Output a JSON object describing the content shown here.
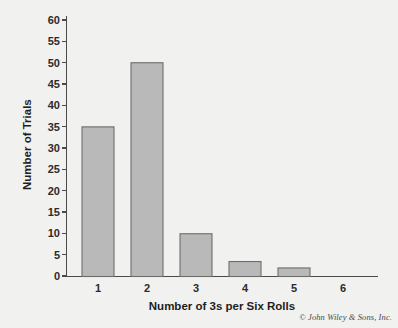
{
  "chart_data": {
    "type": "bar",
    "title": "",
    "subtitle": "",
    "xlabel": "Number of 3s per Six Rolls",
    "ylabel": "Number of Trials",
    "categories": [
      "1",
      "2",
      "3",
      "4",
      "5",
      "6"
    ],
    "values": [
      35,
      50,
      10,
      3.5,
      2,
      0
    ],
    "ylim": [
      0,
      60
    ],
    "xlim": [
      0.4,
      6.9
    ],
    "ytick_labels": [
      "0",
      "5",
      "10",
      "15",
      "20",
      "25",
      "30",
      "35",
      "40",
      "45",
      "50",
      "55",
      "60"
    ],
    "ytick_values": [
      0,
      5,
      10,
      15,
      20,
      25,
      30,
      35,
      40,
      45,
      50,
      55,
      60
    ],
    "ytick_step": 5,
    "grid": false,
    "legend": null,
    "legend_position": "none",
    "series": [
      {
        "name": "Number of Trials",
        "values": [
          35,
          50,
          10,
          3.5,
          2,
          0
        ]
      }
    ],
    "annotations": []
  },
  "colors": {
    "background": "#f1f1ef",
    "bar_fill": "#b9b9b9",
    "bar_stroke": "#6d6d6d",
    "axis": "#4a4a4a",
    "text": "#1e1e1e"
  },
  "footer": {
    "copyright": "© John Wiley & Sons, Inc."
  }
}
